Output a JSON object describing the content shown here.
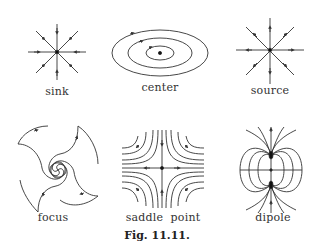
{
  "figure": {
    "caption": "Fig. 11.11.",
    "panels": [
      {
        "id": "sink",
        "label": "sink"
      },
      {
        "id": "center",
        "label": "center"
      },
      {
        "id": "source",
        "label": "source"
      },
      {
        "id": "focus",
        "label": "focus"
      },
      {
        "id": "saddle",
        "label": "saddle  point"
      },
      {
        "id": "dipole",
        "label": "dipole"
      }
    ]
  },
  "colors": {
    "stroke": "#333333",
    "text": "#333333"
  }
}
